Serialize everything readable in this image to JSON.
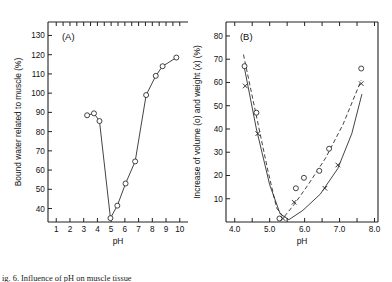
{
  "figure": {
    "caption_partial": "ig. 6. Influence of pH on muscle tissue",
    "panels": [
      {
        "label": "(A)",
        "xlabel": "pH",
        "ylabel": "Bound water related to muscle (%)"
      },
      {
        "label": "(B)",
        "xlabel": "pH",
        "ylabel": "Increase of volume (o) and weight (x) (%)"
      }
    ]
  },
  "chart_data": [
    {
      "type": "line",
      "title": "(A)",
      "xlabel": "pH",
      "ylabel": "Bound water related to muscle (%)",
      "xlim": [
        0.4,
        10.6
      ],
      "ylim": [
        33,
        137
      ],
      "xticks": [
        1,
        2,
        3,
        4,
        5,
        6,
        7,
        8,
        9,
        10
      ],
      "xticklabels": [
        "1",
        "2",
        "3",
        "4",
        "5",
        "6",
        "7",
        "8",
        "9",
        "10"
      ],
      "yticks": [
        40,
        50,
        60,
        70,
        80,
        90,
        100,
        110,
        120,
        130
      ],
      "yticklabels": [
        "40",
        "50",
        "60",
        "70",
        "80",
        "90",
        "100",
        "110",
        "120",
        "130"
      ],
      "grid": false,
      "legend": "none",
      "series": [
        {
          "name": "Bound water",
          "marker": "circle-open",
          "linestyle": "solid",
          "points": [
            {
              "x": 3.25,
              "y": 88.5
            },
            {
              "x": 3.75,
              "y": 89.5
            },
            {
              "x": 4.15,
              "y": 85.5
            },
            {
              "x": 4.95,
              "y": 35.0
            },
            {
              "x": 5.45,
              "y": 41.5
            },
            {
              "x": 6.05,
              "y": 53.0
            },
            {
              "x": 6.75,
              "y": 64.5
            },
            {
              "x": 7.55,
              "y": 99.0
            },
            {
              "x": 8.25,
              "y": 109.0
            },
            {
              "x": 8.75,
              "y": 114.0
            },
            {
              "x": 9.75,
              "y": 118.5
            }
          ]
        }
      ]
    },
    {
      "type": "scatter",
      "title": "(B)",
      "xlabel": "pH",
      "ylabel": "Increase of volume (o) and weight (x) (%)",
      "xlim": [
        3.75,
        8.1
      ],
      "ylim": [
        0,
        86
      ],
      "xticks": [
        4.0,
        4.5,
        5.0,
        5.5,
        6.0,
        6.5,
        7.0,
        7.5,
        8.0
      ],
      "xticklabels": [
        "4.0",
        "",
        "5.0",
        "",
        "6.0",
        "",
        "7.0",
        "",
        "8.0"
      ],
      "yticks": [
        10,
        20,
        30,
        40,
        50,
        60,
        70,
        80
      ],
      "yticklabels": [
        "10",
        "20",
        "30",
        "40",
        "50",
        "60",
        "70",
        "80"
      ],
      "grid": false,
      "legend": "inline-axis-label",
      "series": [
        {
          "name": "Increase of volume (o)",
          "marker": "circle-open",
          "linestyle": "dashed",
          "points": [
            {
              "x": 4.28,
              "y": 67.0
            },
            {
              "x": 4.62,
              "y": 47.0
            },
            {
              "x": 5.28,
              "y": 1.5
            },
            {
              "x": 5.75,
              "y": 14.5
            },
            {
              "x": 5.98,
              "y": 19.0
            },
            {
              "x": 6.42,
              "y": 22.0
            },
            {
              "x": 6.7,
              "y": 31.5
            },
            {
              "x": 7.62,
              "y": 66.0
            }
          ],
          "curve": [
            {
              "x": 4.25,
              "y": 72.0
            },
            {
              "x": 4.6,
              "y": 47.0
            },
            {
              "x": 4.95,
              "y": 22.0
            },
            {
              "x": 5.2,
              "y": 6.0
            },
            {
              "x": 5.4,
              "y": 2.0
            },
            {
              "x": 5.7,
              "y": 7.5
            },
            {
              "x": 6.1,
              "y": 16.0
            },
            {
              "x": 6.6,
              "y": 27.5
            },
            {
              "x": 7.1,
              "y": 42.0
            },
            {
              "x": 7.62,
              "y": 61.0
            }
          ]
        },
        {
          "name": "Increase of weight (x)",
          "marker": "cross",
          "linestyle": "solid",
          "points": [
            {
              "x": 4.3,
              "y": 58.5
            },
            {
              "x": 4.66,
              "y": 38.0
            },
            {
              "x": 5.38,
              "y": 1.5
            },
            {
              "x": 5.7,
              "y": 8.5
            },
            {
              "x": 6.58,
              "y": 14.5
            },
            {
              "x": 6.95,
              "y": 24.5
            },
            {
              "x": 7.62,
              "y": 59.5
            }
          ],
          "curve": [
            {
              "x": 4.28,
              "y": 66.0
            },
            {
              "x": 4.62,
              "y": 40.0
            },
            {
              "x": 5.0,
              "y": 16.0
            },
            {
              "x": 5.3,
              "y": 3.5
            },
            {
              "x": 5.55,
              "y": 1.0
            },
            {
              "x": 5.95,
              "y": 5.0
            },
            {
              "x": 6.45,
              "y": 12.0
            },
            {
              "x": 6.95,
              "y": 23.0
            },
            {
              "x": 7.35,
              "y": 38.0
            },
            {
              "x": 7.64,
              "y": 55.0
            }
          ]
        }
      ]
    }
  ]
}
